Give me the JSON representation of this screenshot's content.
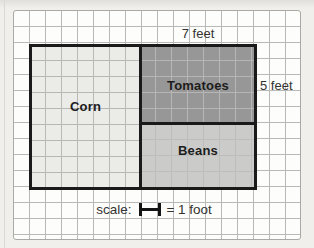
{
  "diagram": {
    "regions": [
      {
        "label": "Corn",
        "fill": "#ebebe8",
        "position": "left-full-height"
      },
      {
        "label": "Tomatoes",
        "fill": "#979797",
        "position": "right-top"
      },
      {
        "label": "Beans",
        "fill": "#cbcbc9",
        "position": "right-bottom"
      }
    ],
    "dimensions": {
      "width_label": "7 feet",
      "height_label": "5 feet"
    },
    "scale": {
      "prefix": "scale:",
      "suffix": "= 1 foot",
      "symbol": "one-foot-length-icon"
    },
    "colors": {
      "plot_border": "#1a1a1a",
      "grid_line": "#b9b9b7",
      "paper": "#fdfdfc",
      "page_background": "#f0efec"
    }
  }
}
